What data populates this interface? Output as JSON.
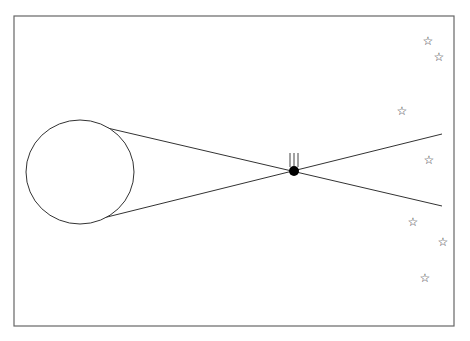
{
  "diagram": {
    "frame": {
      "x": 14,
      "y": 16,
      "width": 440,
      "height": 310,
      "stroke": "#666666"
    },
    "large_body": {
      "cx": 80,
      "cy": 172,
      "rx": 54,
      "ry": 52,
      "stroke": "#333333",
      "fill": "#ffffff"
    },
    "tangent_lines": [
      {
        "x1": 103,
        "y1": 127,
        "x2": 442,
        "y2": 206
      },
      {
        "x1": 103,
        "y1": 218,
        "x2": 442,
        "y2": 134
      }
    ],
    "small_body": {
      "cx": 294,
      "cy": 171,
      "r": 5,
      "fill": "#000000"
    },
    "tail_lines": [
      {
        "x1": 290,
        "y1": 153,
        "x2": 290,
        "y2": 167
      },
      {
        "x1": 294,
        "y1": 153,
        "x2": 294,
        "y2": 166
      },
      {
        "x1": 298,
        "y1": 153,
        "x2": 298,
        "y2": 167
      }
    ],
    "stars": [
      {
        "x": 428,
        "y": 41,
        "glyph": "☆"
      },
      {
        "x": 439,
        "y": 57,
        "glyph": "☆"
      },
      {
        "x": 402,
        "y": 111,
        "glyph": "☆"
      },
      {
        "x": 429,
        "y": 160,
        "glyph": "☆"
      },
      {
        "x": 413,
        "y": 222,
        "glyph": "☆"
      },
      {
        "x": 443,
        "y": 242,
        "glyph": "☆"
      },
      {
        "x": 425,
        "y": 278,
        "glyph": "☆"
      }
    ]
  }
}
